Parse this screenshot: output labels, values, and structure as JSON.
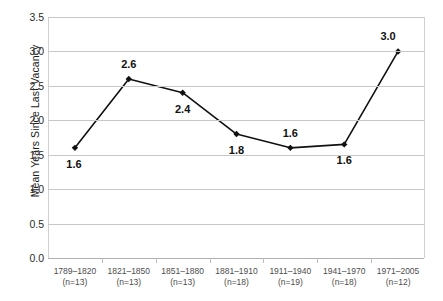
{
  "chart_data": {
    "type": "line",
    "title": "",
    "xlabel": "",
    "ylabel": "Mean Years Since Last Vacancy",
    "ylim": [
      0.0,
      3.5
    ],
    "yticks": [
      "0.0",
      "0.5",
      "1.0",
      "1.5",
      "2.0",
      "2.5",
      "3.0",
      "3.5"
    ],
    "grid": true,
    "legend": "none",
    "categories": [
      "1789–1820",
      "1821–1850",
      "1851–1880",
      "1881–1910",
      "1911–1940",
      "1941–1970",
      "1971–2005"
    ],
    "category_counts": [
      "(n=13)",
      "(n=13)",
      "(n=13)",
      "(n=18)",
      "(n=19)",
      "(n=18)",
      "(n=12)"
    ],
    "values": [
      1.6,
      2.6,
      2.4,
      1.8,
      1.6,
      1.65,
      3.0
    ],
    "data_labels": [
      "1.6",
      "2.6",
      "2.4",
      "1.8",
      "1.6",
      "1.6",
      "3.0"
    ],
    "data_label_positions": [
      "below",
      "above",
      "below",
      "below",
      "above",
      "below",
      "above"
    ],
    "series": [
      {
        "name": "Mean Years Since Last Vacancy",
        "values": [
          1.6,
          2.6,
          2.4,
          1.8,
          1.6,
          1.65,
          3.0
        ],
        "color": "#111111",
        "marker": "diamond"
      }
    ]
  },
  "style": {
    "line_color": "#111111",
    "marker_color": "#111111",
    "gridline_color": "#c8c8c8",
    "axis_color": "#b0b0b0",
    "label_color": "#111111",
    "tick_color": "#4d4d4d",
    "background": "#ffffff"
  }
}
